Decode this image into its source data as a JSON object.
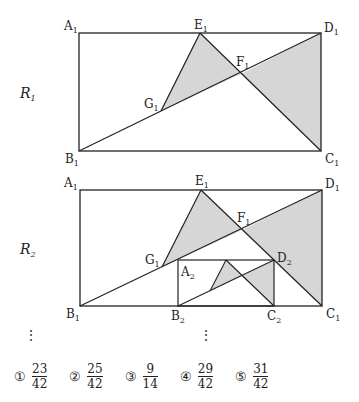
{
  "figures": [
    {
      "id": "R1",
      "label": "R",
      "label_sub": "1",
      "points": {
        "A1": {
          "name": "A",
          "sub": "1"
        },
        "B1": {
          "name": "B",
          "sub": "1"
        },
        "C1": {
          "name": "C",
          "sub": "1"
        },
        "D1": {
          "name": "D",
          "sub": "1"
        },
        "E1": {
          "name": "E",
          "sub": "1"
        },
        "F1": {
          "name": "F",
          "sub": "1"
        },
        "G1": {
          "name": "G",
          "sub": "1"
        }
      }
    },
    {
      "id": "R2",
      "label": "R",
      "label_sub": "2",
      "points": {
        "A1": {
          "name": "A",
          "sub": "1"
        },
        "B1": {
          "name": "B",
          "sub": "1"
        },
        "C1": {
          "name": "C",
          "sub": "1"
        },
        "D1": {
          "name": "D",
          "sub": "1"
        },
        "E1": {
          "name": "E",
          "sub": "1"
        },
        "F1": {
          "name": "F",
          "sub": "1"
        },
        "G1": {
          "name": "G",
          "sub": "1"
        },
        "A2": {
          "name": "A",
          "sub": "2"
        },
        "B2": {
          "name": "B",
          "sub": "2"
        },
        "C2": {
          "name": "C",
          "sub": "2"
        },
        "D2": {
          "name": "D",
          "sub": "2"
        }
      }
    }
  ],
  "colors": {
    "shade": "#d6d6d6",
    "stroke": "#222222"
  },
  "continuation": "⋮",
  "choices": [
    {
      "num": "①",
      "numerator": "23",
      "denominator": "42"
    },
    {
      "num": "②",
      "numerator": "25",
      "denominator": "42"
    },
    {
      "num": "③",
      "numerator": "9",
      "denominator": "14"
    },
    {
      "num": "④",
      "numerator": "29",
      "denominator": "42"
    },
    {
      "num": "⑤",
      "numerator": "31",
      "denominator": "42"
    }
  ]
}
